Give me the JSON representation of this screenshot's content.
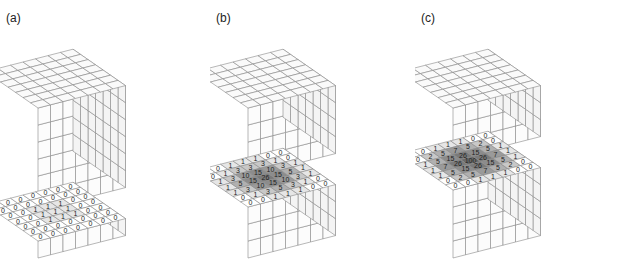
{
  "panels": [
    {
      "label": "(a)",
      "block_layers": 6,
      "slice_layers": 1,
      "grid": [
        [
          0,
          0,
          0,
          0,
          0,
          0,
          0
        ],
        [
          0,
          0,
          0,
          0,
          0,
          0,
          0
        ],
        [
          0,
          0,
          1,
          1,
          1,
          0,
          0
        ],
        [
          0,
          0,
          1,
          1,
          1,
          0,
          0
        ],
        [
          0,
          0,
          1,
          1,
          1,
          0,
          0
        ],
        [
          0,
          0,
          0,
          0,
          0,
          0,
          0
        ],
        [
          0,
          0,
          0,
          0,
          0,
          0,
          0
        ]
      ]
    },
    {
      "label": "(b)",
      "block_layers": 4,
      "slice_layers": 3,
      "grid": [
        [
          0,
          0,
          1,
          1,
          1,
          0,
          0
        ],
        [
          0,
          1,
          3,
          3,
          3,
          1,
          0
        ],
        [
          1,
          3,
          10,
          15,
          10,
          3,
          1
        ],
        [
          1,
          5,
          15,
          26,
          15,
          5,
          1
        ],
        [
          1,
          3,
          10,
          15,
          10,
          3,
          1
        ],
        [
          0,
          1,
          3,
          5,
          3,
          1,
          0
        ],
        [
          0,
          0,
          1,
          1,
          1,
          0,
          0
        ]
      ]
    },
    {
      "label": "(c)",
      "block_layers": 3,
      "slice_layers": 4,
      "grid": [
        [
          0,
          0,
          1,
          1,
          1,
          0,
          0
        ],
        [
          0,
          2,
          5,
          7,
          5,
          2,
          0
        ],
        [
          1,
          5,
          15,
          26,
          15,
          5,
          1
        ],
        [
          1,
          7,
          26,
          100,
          26,
          7,
          1
        ],
        [
          1,
          5,
          15,
          26,
          15,
          5,
          1
        ],
        [
          0,
          2,
          5,
          7,
          5,
          2,
          0
        ],
        [
          0,
          0,
          1,
          1,
          1,
          0,
          0
        ]
      ]
    }
  ],
  "shading": {
    "levels": [
      {
        "max": 0,
        "color": "#ffffff"
      },
      {
        "max": 1,
        "color": "#e6e6e6"
      },
      {
        "max": 3,
        "color": "#c8c8c8"
      },
      {
        "max": 5,
        "color": "#b0b0b0"
      },
      {
        "max": 10,
        "color": "#9a9a9a"
      },
      {
        "max": 15,
        "color": "#8c8c8c"
      },
      {
        "max": 26,
        "color": "#7a7a7a"
      },
      {
        "max": 100,
        "color": "#6a6a6a"
      }
    ],
    "line_color": "#888888"
  }
}
